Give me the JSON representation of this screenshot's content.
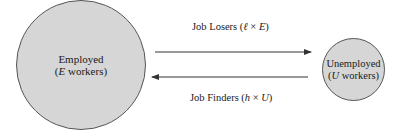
{
  "diagram": {
    "type": "flow",
    "colors": {
      "node_fill": "#d6d6d6",
      "node_stroke": "#555555",
      "arrow": "#333333",
      "text": "#1a1a1a"
    },
    "nodes": {
      "employed": {
        "title": "Employed",
        "open": "(",
        "var": "E",
        "rest": " workers)"
      },
      "unemployed": {
        "title": "Unemployed",
        "open": "(",
        "var": "U",
        "rest": " workers)"
      }
    },
    "edges": {
      "job_losers": {
        "label": "Job Losers (",
        "rate": "ℓ",
        "op": " × ",
        "var": "E",
        "close": ")",
        "from": "Employed",
        "to": "Unemployed"
      },
      "job_finders": {
        "label": "Job Finders (",
        "rate": "h",
        "op": " × ",
        "var": "U",
        "close": ")",
        "from": "Unemployed",
        "to": "Employed"
      }
    }
  }
}
